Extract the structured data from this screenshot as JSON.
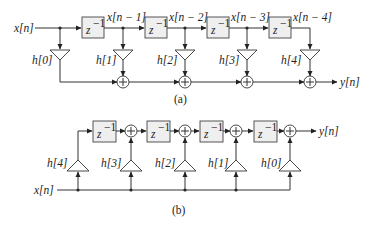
{
  "figure": {
    "a": {
      "caption": "(a)",
      "input_label": "x[n]",
      "output_label": "y[n]",
      "delay_label": "z",
      "delay_exp": "−1",
      "tap_labels": [
        "x[n − 1]",
        "x[n − 2]",
        "x[n − 3]",
        "x[n − 4]"
      ],
      "coef_labels": [
        "h[0]",
        "h[1]",
        "h[2]",
        "h[3]",
        "h[4]"
      ],
      "adder_symbol": "+"
    },
    "b": {
      "caption": "(b)",
      "input_label": "x[n]",
      "output_label": "y[n]",
      "delay_label": "z",
      "delay_exp": "−1",
      "coef_labels": [
        "h[4]",
        "h[3]",
        "h[2]",
        "h[1]",
        "h[0]"
      ],
      "adder_symbol": "+"
    }
  }
}
